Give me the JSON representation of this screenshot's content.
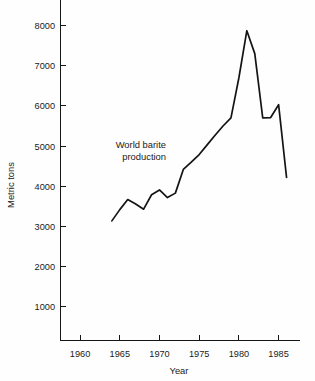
{
  "chart_data": {
    "type": "line",
    "title": "",
    "xlabel": "Year",
    "ylabel": "Metric tons",
    "annotation": "World barite\nproduction",
    "annotation_line1": "World barite",
    "annotation_line2": "production",
    "grid": false,
    "legend": "none",
    "xlim": [
      1956,
      1988
    ],
    "ylim": [
      0,
      8600
    ],
    "xticks": [
      1960,
      1965,
      1970,
      1975,
      1980,
      1985
    ],
    "xtick_labels": [
      "1960",
      "1965",
      "1970",
      "1975",
      "1980",
      "1985"
    ],
    "yticks": [
      1000,
      2000,
      3000,
      4000,
      5000,
      6000,
      7000,
      8000
    ],
    "ytick_labels": [
      "1000",
      "2000",
      "3000",
      "4000",
      "5000",
      "6000",
      "7000",
      "8000"
    ],
    "series": [
      {
        "name": "World barite production",
        "units": "Metric tons",
        "x": [
          1964,
          1965,
          1966,
          1967,
          1968,
          1969,
          1970,
          1971,
          1972,
          1973,
          1974,
          1975,
          1976,
          1977,
          1978,
          1979,
          1980,
          1981,
          1982,
          1983,
          1984,
          1985,
          1986
        ],
        "values": [
          3140,
          3420,
          3670,
          3560,
          3430,
          3790,
          3910,
          3720,
          3830,
          4420,
          4600,
          4790,
          5030,
          5270,
          5500,
          5700,
          6700,
          7870,
          7300,
          5700,
          5710,
          6030,
          4220
        ]
      }
    ],
    "line_color": "#141414"
  },
  "axes": {
    "y_axis_label": "Metric tons",
    "x_axis_label": "Year"
  }
}
